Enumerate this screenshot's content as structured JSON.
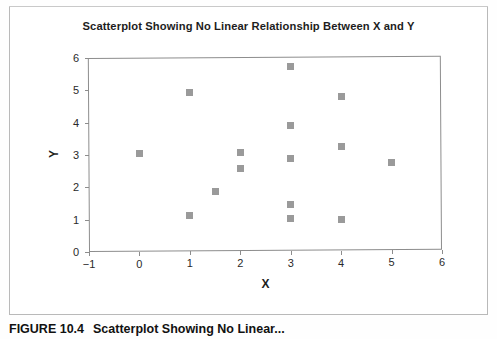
{
  "figure": {
    "title": "Scatterplot Showing No Linear Relationship Between X and Y",
    "caption_label": "FIGURE 10.4",
    "caption_text": "Scatterplot Showing No Linear..."
  },
  "colors": {
    "marker": "#9a9a9a",
    "axis": "#8d8d8d",
    "border": "#b9b9b9",
    "text": "#1d1d1d",
    "background": "#ffffff"
  },
  "chart_data": {
    "type": "scatter",
    "title": "Scatterplot Showing No Linear Relationship Between X and Y",
    "xlabel": "X",
    "ylabel": "Y",
    "xlim": [
      -1,
      6
    ],
    "ylim": [
      0,
      6
    ],
    "xticks": [
      -1,
      0,
      1,
      2,
      3,
      4,
      5,
      6
    ],
    "yticks": [
      0,
      1,
      2,
      3,
      4,
      5,
      6
    ],
    "xticklabels": [
      "−1",
      "0",
      "1",
      "2",
      "3",
      "4",
      "5",
      "6"
    ],
    "yticklabels": [
      "0",
      "1",
      "2",
      "3",
      "4",
      "5",
      "6"
    ],
    "grid": false,
    "legend": null,
    "marker": "square",
    "points": [
      {
        "x": 0,
        "y": 3.05
      },
      {
        "x": 1,
        "y": 4.9
      },
      {
        "x": 1,
        "y": 1.1
      },
      {
        "x": 1.5,
        "y": 1.85
      },
      {
        "x": 2,
        "y": 3.05
      },
      {
        "x": 2,
        "y": 2.55
      },
      {
        "x": 3,
        "y": 5.7
      },
      {
        "x": 3,
        "y": 3.87
      },
      {
        "x": 3,
        "y": 2.85
      },
      {
        "x": 3,
        "y": 1.43
      },
      {
        "x": 3,
        "y": 1.0
      },
      {
        "x": 4,
        "y": 4.76
      },
      {
        "x": 4,
        "y": 3.22
      },
      {
        "x": 4,
        "y": 0.95
      },
      {
        "x": 5,
        "y": 2.72
      }
    ]
  }
}
